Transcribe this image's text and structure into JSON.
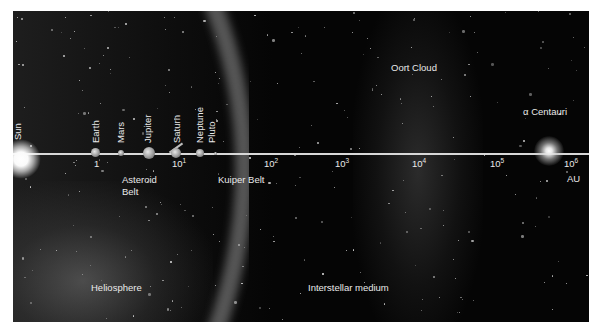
{
  "figure": {
    "type": "log-scale distance diagram",
    "axis_unit": "AU",
    "axis_ticks": [
      {
        "base": "1",
        "exp": ""
      },
      {
        "base": "10",
        "exp": "1"
      },
      {
        "base": "10",
        "exp": "2"
      },
      {
        "base": "10",
        "exp": "3"
      },
      {
        "base": "10",
        "exp": "4"
      },
      {
        "base": "10",
        "exp": "5"
      },
      {
        "base": "10",
        "exp": "6"
      }
    ],
    "bodies": [
      {
        "name": "Sun"
      },
      {
        "name": "Earth"
      },
      {
        "name": "Mars"
      },
      {
        "name": "Jupiter"
      },
      {
        "name": "Saturn"
      },
      {
        "name": "Neptune"
      },
      {
        "name": "Pluto"
      },
      {
        "name": "α Centauri"
      }
    ],
    "regions": {
      "asteroid_belt_line1": "Asteroid",
      "asteroid_belt_line2": "Belt",
      "kuiper_belt": "Kuiper Belt",
      "oort_cloud": "Oort Cloud",
      "heliosphere": "Heliosphere",
      "interstellar_medium": "Interstellar medium"
    },
    "colors": {
      "background": "#050505",
      "frame": "#ffffff",
      "text": "#e9e9e9",
      "axis": "#d8d8d8"
    }
  }
}
